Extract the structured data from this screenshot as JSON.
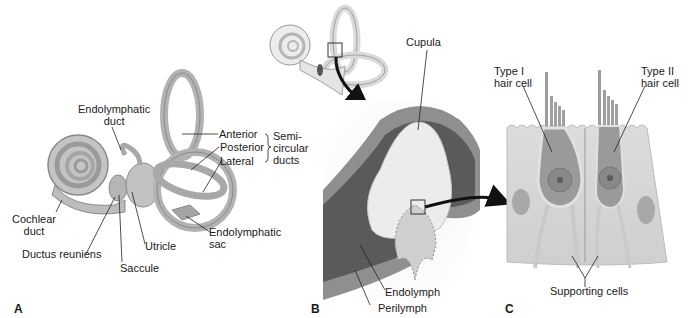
{
  "figure": {
    "panels": [
      {
        "id": "A",
        "letter": "A",
        "description": "Membranous labyrinth of inner ear",
        "labels": {
          "endolymphatic_duct_1": "Endolymphatic",
          "endolymphatic_duct_2": "duct",
          "anterior": "Anterior",
          "posterior": "Posterior",
          "lateral": "Lateral",
          "semicircular_1": "Semi-",
          "semicircular_2": "circular",
          "semicircular_3": "ducts",
          "cochlear_duct_1": "Cochlear",
          "cochlear_duct_2": "duct",
          "ductus_reuniens": "Ductus reuniens",
          "saccule": "Saccule",
          "utricle": "Utricle",
          "endolymphatic_sac_1": "Endolymphatic",
          "endolymphatic_sac_2": "sac"
        }
      },
      {
        "id": "B",
        "letter": "B",
        "description": "Ampulla crista with cupula",
        "labels": {
          "cupula": "Cupula",
          "endolymph": "Endolymph",
          "perilymph": "Perilymph"
        }
      },
      {
        "id": "C",
        "letter": "C",
        "description": "Vestibular hair cells",
        "labels": {
          "type1_1": "Type I",
          "type1_2": "hair cell",
          "type2_1": "Type II",
          "type2_2": "hair cell",
          "supporting_cells": "Supporting cells"
        }
      }
    ],
    "colors": {
      "labyrinth": "#b8b8b8",
      "labyrinth_dark": "#8f8f8f",
      "ampulla_outer": "#9a9a9a",
      "ampulla_dark": "#5e5e5e",
      "cupula": "#ededed",
      "cell_bg": "#d9d9d9",
      "hair_cell": "#9c9c9c"
    }
  }
}
